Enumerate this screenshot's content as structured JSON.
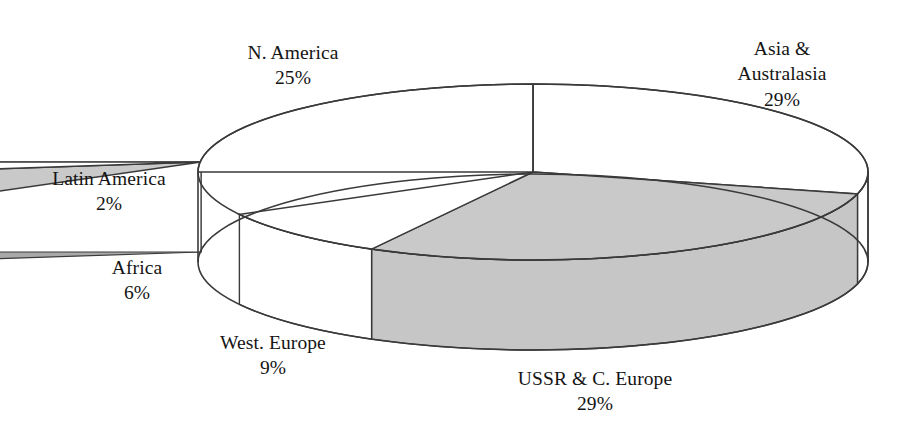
{
  "chart_data": {
    "type": "pie",
    "title": "",
    "subtitle": "",
    "xlabel": "",
    "ylabel": "",
    "legend_position": "none",
    "grid": false,
    "style": "3d-exploded-pie",
    "units": "percent",
    "categories": [
      "Asia & Australasia",
      "USSR & C. Europe",
      "West. Europe",
      "Africa",
      "Latin America",
      "N. America"
    ],
    "values": [
      29,
      29,
      9,
      6,
      2,
      25
    ],
    "value_labels": [
      "29%",
      "29%",
      "9%",
      "6%",
      "2%",
      "25%"
    ],
    "slices": [
      {
        "name": "Asia & Australasia",
        "label": "Asia & Australasia",
        "value": 29,
        "value_label": "29%",
        "fill": "#ffffff",
        "side_fill": "#ffffff",
        "exploded": false,
        "start_deg": 0,
        "end_deg": 104.4
      },
      {
        "name": "USSR & C. Europe",
        "label": "USSR & C. Europe",
        "value": 29,
        "value_label": "29%",
        "fill": "#c9c9c9",
        "side_fill": "#c6c6c6",
        "exploded": false,
        "start_deg": 104.4,
        "end_deg": 208.8
      },
      {
        "name": "West. Europe",
        "label": "West. Europe",
        "value": 9,
        "value_label": "9%",
        "fill": "#ffffff",
        "side_fill": "#ffffff",
        "exploded": false,
        "start_deg": 208.8,
        "end_deg": 241.2
      },
      {
        "name": "Africa",
        "label": "Africa",
        "value": 6,
        "value_label": "6%",
        "fill": "#c9c9c9",
        "side_fill": "#a9a9a9",
        "exploded": true,
        "start_deg": 241.2,
        "end_deg": 262.8
      },
      {
        "name": "Latin America",
        "label": "Latin America",
        "value": 2,
        "value_label": "2%",
        "fill": "#ffffff",
        "side_fill": "#ffffff",
        "exploded": true,
        "start_deg": 262.8,
        "end_deg": 270.0
      },
      {
        "name": "N. America",
        "label": "N. America",
        "value": 25,
        "value_label": "25%",
        "fill": "#ffffff",
        "side_fill": "#ffffff",
        "exploded": false,
        "start_deg": 270.0,
        "end_deg": 360.0
      }
    ],
    "colors": {
      "gray_top": "#c9c9c9",
      "gray_side": "#b4b4b4",
      "white": "#ffffff",
      "outline": "#3a3a3a",
      "text": "#141414",
      "background": "#ffffff"
    }
  },
  "labels": {
    "n_america": {
      "name": "N. America",
      "pct": "25%"
    },
    "asia": {
      "name_line1": "Asia &",
      "name_line2": "Australasia",
      "pct": "29%"
    },
    "latin_america": {
      "name": "Latin America",
      "pct": "2%"
    },
    "africa": {
      "name": "Africa",
      "pct": "6%"
    },
    "west_europe": {
      "name": "West. Europe",
      "pct": "9%"
    },
    "ussr": {
      "name": "USSR & C. Europe",
      "pct": "29%"
    }
  }
}
